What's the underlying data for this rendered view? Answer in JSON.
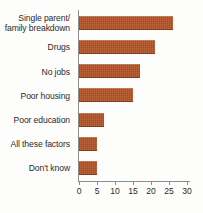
{
  "chart_data": {
    "type": "bar",
    "orientation": "horizontal",
    "title": "",
    "xlabel": "",
    "ylabel": "",
    "categories": [
      "Single parent/ family breakdown",
      "Drugs",
      "No jobs",
      "Poor housing",
      "Poor education",
      "All these factors",
      "Don't know"
    ],
    "category_lines": [
      [
        "Single parent/",
        "family breakdown"
      ],
      [
        "Drugs"
      ],
      [
        "No jobs"
      ],
      [
        "Poor housing"
      ],
      [
        "Poor education"
      ],
      [
        "All these factors"
      ],
      [
        "Don't know"
      ]
    ],
    "values": [
      26,
      21,
      17,
      15,
      7,
      5,
      5
    ],
    "xlim": [
      0,
      30
    ],
    "xticks": [
      0,
      5,
      10,
      15,
      20,
      25,
      30
    ],
    "xtick_labels": [
      "0",
      "5",
      "10",
      "15",
      "20",
      "25",
      "30"
    ],
    "grid": false,
    "legend": false,
    "bar_color": "#b5562a",
    "axis_color": "#8d8d8d",
    "text_color": "#2b2b2b",
    "background_color": "#fdfdfb"
  }
}
